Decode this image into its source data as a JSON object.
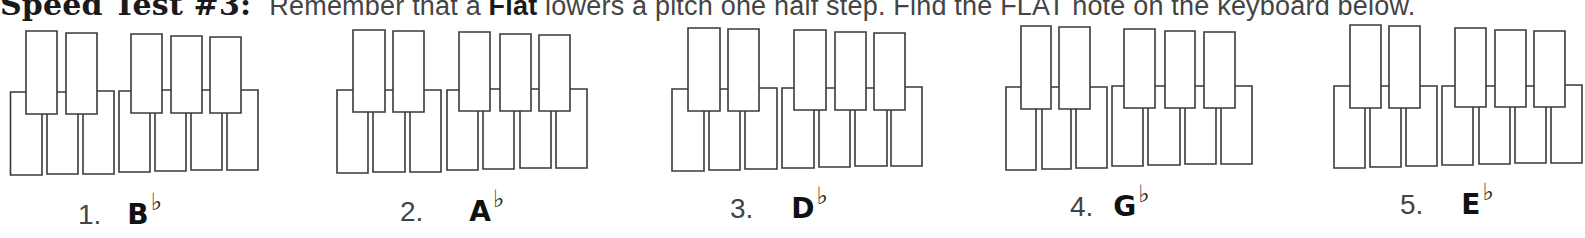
{
  "header": {
    "title": "Speed Test #3:",
    "text_before": "Remember that a ",
    "bold_word": "Flat",
    "text_after": " lowers a pitch one half step. Find the FLAT note on the keyboard below."
  },
  "colors": {
    "key_outline": "#3a3a3a",
    "key_fill": "#ffffff",
    "text": "#2a2a2a"
  },
  "keyboard_spec": {
    "white_keys_per_keyboard": 7,
    "black_keys_per_keyboard": 5,
    "black_key_grouping": [
      2,
      3
    ]
  },
  "exercises": [
    {
      "number": "1.",
      "note": "B",
      "accidental": "♭"
    },
    {
      "number": "2.",
      "note": "A",
      "accidental": "♭"
    },
    {
      "number": "3.",
      "note": "D",
      "accidental": "♭"
    },
    {
      "number": "4.",
      "note": "G",
      "accidental": "♭"
    },
    {
      "number": "5.",
      "note": "E",
      "accidental": "♭"
    }
  ]
}
